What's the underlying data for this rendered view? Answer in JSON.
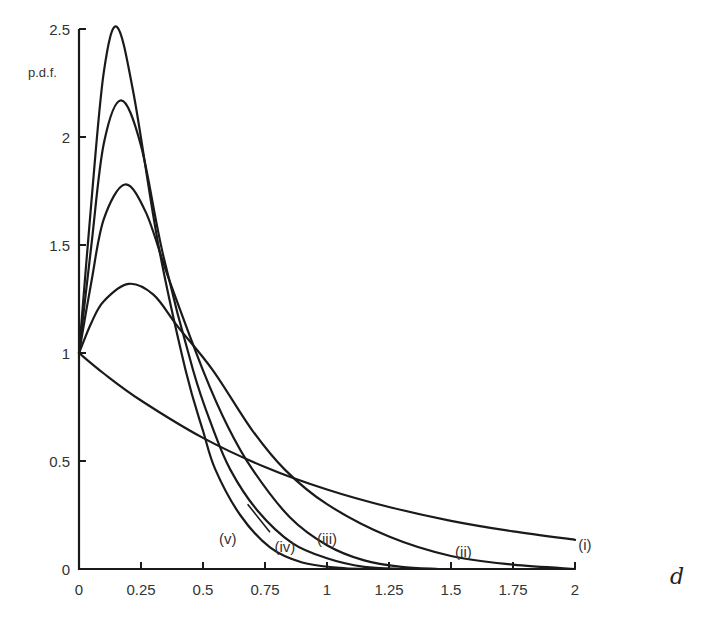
{
  "chart_data": {
    "type": "line",
    "title": "",
    "xlabel": "d",
    "ylabel": "p.d.f.",
    "xlim": [
      0,
      2
    ],
    "ylim": [
      0,
      2.5
    ],
    "grid": false,
    "legend": "inline labels at curve ends",
    "x_ticks": [
      "0",
      "0.25",
      "0.5",
      "0.75",
      "1",
      "1.25",
      "1.5",
      "1.75",
      "2"
    ],
    "y_ticks": [
      "0",
      "0.5",
      "1",
      "1.5",
      "2",
      "2.5"
    ],
    "series": [
      {
        "name": "(i)",
        "points": [
          [
            0,
            1.0
          ],
          [
            0.1,
            0.905
          ],
          [
            0.25,
            0.78
          ],
          [
            0.5,
            0.607
          ],
          [
            0.75,
            0.472
          ],
          [
            1.0,
            0.368
          ],
          [
            1.25,
            0.287
          ],
          [
            1.5,
            0.223
          ],
          [
            1.75,
            0.174
          ],
          [
            2.0,
            0.135
          ]
        ],
        "label_pos": [
          2.04,
          0.11
        ]
      },
      {
        "name": "(ii)",
        "points": [
          [
            0,
            1.0
          ],
          [
            0.05,
            1.14
          ],
          [
            0.1,
            1.24
          ],
          [
            0.2,
            1.32
          ],
          [
            0.3,
            1.27
          ],
          [
            0.4,
            1.12
          ],
          [
            0.54,
            0.92
          ],
          [
            0.7,
            0.64
          ],
          [
            0.83,
            0.46
          ],
          [
            1.0,
            0.3
          ],
          [
            1.25,
            0.15
          ],
          [
            1.5,
            0.06
          ],
          [
            1.75,
            0.02
          ],
          [
            2.0,
            0.0
          ]
        ],
        "label_pos": [
          1.55,
          0.08
        ]
      },
      {
        "name": "(iii)",
        "points": [
          [
            0,
            1.0
          ],
          [
            0.05,
            1.33
          ],
          [
            0.1,
            1.62
          ],
          [
            0.185,
            1.78
          ],
          [
            0.27,
            1.65
          ],
          [
            0.36,
            1.35
          ],
          [
            0.5,
            0.92
          ],
          [
            0.6,
            0.66
          ],
          [
            0.7,
            0.46
          ],
          [
            0.85,
            0.24
          ],
          [
            1.0,
            0.11
          ],
          [
            1.15,
            0.04
          ],
          [
            1.3,
            0.01
          ],
          [
            1.45,
            0.0
          ]
        ],
        "label_pos": [
          1.0,
          0.14
        ]
      },
      {
        "name": "(iv)",
        "points": [
          [
            0,
            1.0
          ],
          [
            0.05,
            1.5
          ],
          [
            0.1,
            1.97
          ],
          [
            0.17,
            2.17
          ],
          [
            0.25,
            1.96
          ],
          [
            0.34,
            1.45
          ],
          [
            0.46,
            0.92
          ],
          [
            0.54,
            0.65
          ],
          [
            0.61,
            0.46
          ],
          [
            0.72,
            0.27
          ],
          [
            0.86,
            0.12
          ],
          [
            1.0,
            0.05
          ],
          [
            1.15,
            0.01
          ],
          [
            1.3,
            0.0
          ]
        ],
        "label_pos": [
          0.83,
          0.1
        ]
      },
      {
        "name": "(v)",
        "points": [
          [
            0,
            1.0
          ],
          [
            0.05,
            1.7
          ],
          [
            0.1,
            2.3
          ],
          [
            0.153,
            2.51
          ],
          [
            0.22,
            2.2
          ],
          [
            0.32,
            1.5
          ],
          [
            0.43,
            0.92
          ],
          [
            0.5,
            0.64
          ],
          [
            0.55,
            0.46
          ],
          [
            0.65,
            0.25
          ],
          [
            0.77,
            0.1
          ],
          [
            0.9,
            0.03
          ],
          [
            1.05,
            0.005
          ],
          [
            1.15,
            0.0
          ]
        ],
        "label_pos": [
          0.6,
          0.14
        ]
      }
    ]
  },
  "labels": {
    "ylabel": "p.d.f.",
    "xlabel": "d"
  },
  "colors": {
    "line": "#1a1a1a",
    "text": "#333333",
    "background": "#ffffff"
  }
}
